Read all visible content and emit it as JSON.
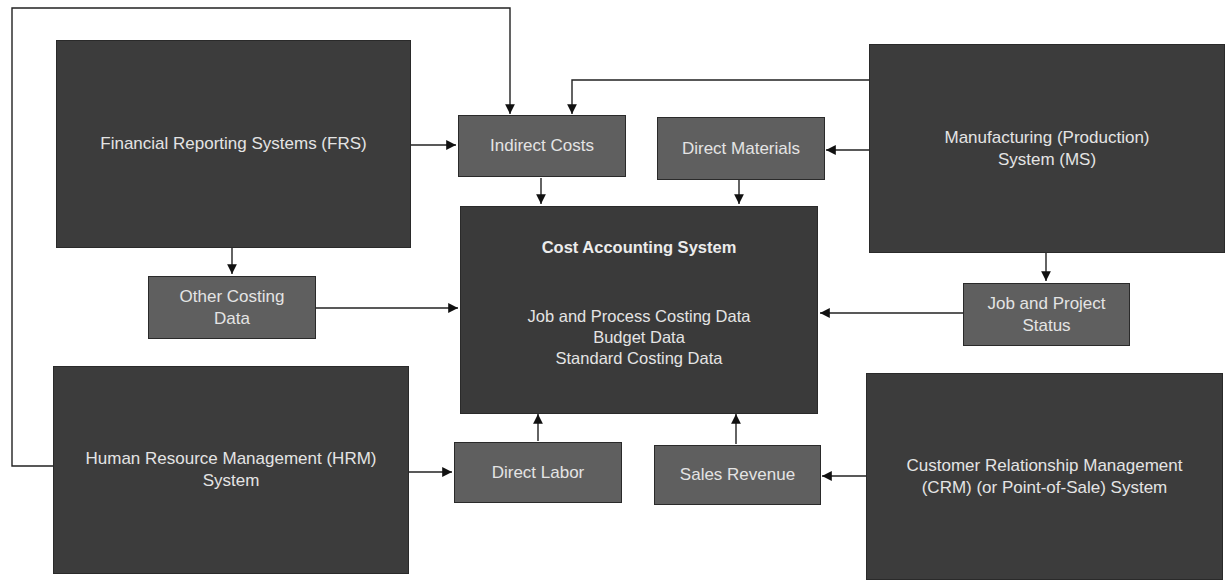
{
  "diagram": {
    "systems": {
      "frs": "Financial Reporting Systems (FRS)",
      "ms_line1": "Manufacturing (Production)",
      "ms_line2": "System (MS)",
      "hrm_line1": "Human Resource Management (HRM)",
      "hrm_line2": "System",
      "crm_line1": "Customer Relationship Management",
      "crm_line2": "(CRM) (or Point-of-Sale) System"
    },
    "data_items": {
      "indirect_costs": "Indirect Costs",
      "direct_materials": "Direct Materials",
      "other_costing_line1": "Other Costing",
      "other_costing_line2": "Data",
      "job_project_line1": "Job and Project",
      "job_project_line2": "Status",
      "direct_labor": "Direct Labor",
      "sales_revenue": "Sales Revenue"
    },
    "central": {
      "title": "Cost Accounting System",
      "lines": [
        "Job and Process Costing Data",
        "Budget Data",
        "Standard Costing Data"
      ]
    },
    "connections": [
      {
        "from": "Financial Reporting Systems (FRS)",
        "to": "Indirect Costs"
      },
      {
        "from": "Financial Reporting Systems (FRS)",
        "to": "Other Costing Data"
      },
      {
        "from": "Human Resource Management (HRM) System",
        "to": "Indirect Costs"
      },
      {
        "from": "Human Resource Management (HRM) System",
        "to": "Direct Labor"
      },
      {
        "from": "Manufacturing (Production) System (MS)",
        "to": "Indirect Costs"
      },
      {
        "from": "Manufacturing (Production) System (MS)",
        "to": "Direct Materials"
      },
      {
        "from": "Manufacturing (Production) System (MS)",
        "to": "Job and Project Status"
      },
      {
        "from": "Customer Relationship Management (CRM) (or Point-of-Sale) System",
        "to": "Sales Revenue"
      },
      {
        "from": "Indirect Costs",
        "to": "Cost Accounting System"
      },
      {
        "from": "Direct Materials",
        "to": "Cost Accounting System"
      },
      {
        "from": "Other Costing Data",
        "to": "Cost Accounting System"
      },
      {
        "from": "Job and Project Status",
        "to": "Cost Accounting System"
      },
      {
        "from": "Direct Labor",
        "to": "Cost Accounting System"
      },
      {
        "from": "Sales Revenue",
        "to": "Cost Accounting System"
      }
    ]
  }
}
